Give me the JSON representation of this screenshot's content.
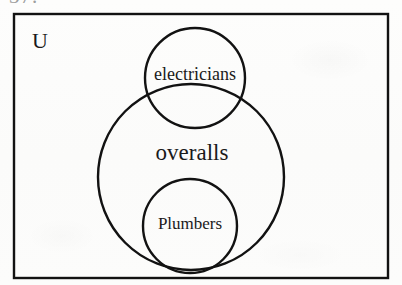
{
  "figure": {
    "kind": "euler-diagram",
    "clipped_header_text": "37.",
    "universal_set_label": "U",
    "stroke_color": "#121212",
    "background_color": "#fcfcfb",
    "text_color": "#1a1a1a",
    "frame": {
      "label": "U",
      "x": 14,
      "y": 14,
      "width": 374,
      "height": 264,
      "stroke_width": 2.4
    },
    "sets": [
      {
        "id": "overalls",
        "label": "overalls",
        "cx": 191,
        "cy": 177,
        "r": 93,
        "stroke_width": 2.4,
        "label_x": 192,
        "label_y": 155,
        "font_size": 23
      },
      {
        "id": "electricians",
        "label": "electricians",
        "cx": 195,
        "cy": 78,
        "r": 50,
        "stroke_width": 2.4,
        "label_x": 195,
        "label_y": 76,
        "font_size": 18
      },
      {
        "id": "plumbers",
        "label": "Plumbers",
        "cx": 190,
        "cy": 226,
        "r": 47,
        "stroke_width": 2.4,
        "label_x": 190,
        "label_y": 225,
        "font_size": 17
      }
    ],
    "relationships": [
      "Plumbers is a subset of overalls",
      "electricians partially overlaps overalls",
      "all sets lie within the universal set U"
    ]
  }
}
